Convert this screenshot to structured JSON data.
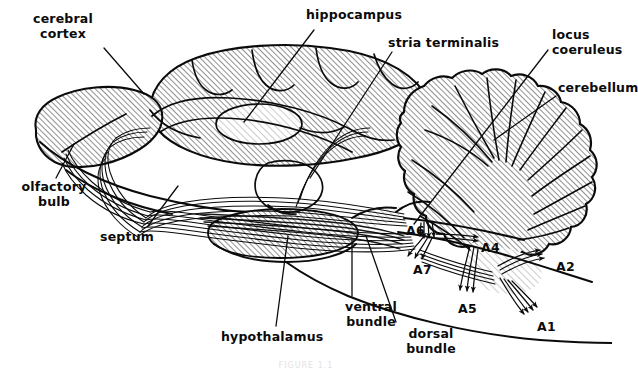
{
  "figure": {
    "background_color": "#ffffff",
    "ink_color": "#0b0b0b",
    "hatch_color": "#4a4a4a",
    "caption": "FIGURE 1.1"
  },
  "labels": [
    {
      "id": "cerebral-cortex",
      "text": "cerebral\ncortex",
      "x": 18,
      "y": 14,
      "align": "center",
      "w": 90
    },
    {
      "id": "hippocampus",
      "text": "hippocampus",
      "x": 306,
      "y": 10,
      "align": "left",
      "w": 110
    },
    {
      "id": "stria-terminalis",
      "text": "stria terminalis",
      "x": 388,
      "y": 38,
      "align": "left",
      "w": 120
    },
    {
      "id": "locus-coeruleus",
      "text": "locus\ncoeruleus",
      "x": 552,
      "y": 30,
      "align": "left",
      "w": 80
    },
    {
      "id": "cerebellum",
      "text": "cerebellum",
      "x": 558,
      "y": 83,
      "align": "left",
      "w": 80
    },
    {
      "id": "olfactory-bulb",
      "text": "olfactory\nbulb",
      "x": 12,
      "y": 182,
      "align": "center",
      "w": 86
    },
    {
      "id": "septum",
      "text": "septum",
      "x": 100,
      "y": 232,
      "align": "left",
      "w": 60
    },
    {
      "id": "hypothalamus",
      "text": "hypothalamus",
      "x": 221,
      "y": 332,
      "align": "left",
      "w": 110
    },
    {
      "id": "ventral-bundle",
      "text": "ventral\nbundle",
      "x": 336,
      "y": 302,
      "align": "center",
      "w": 70
    },
    {
      "id": "dorsal-bundle",
      "text": "dorsal\nbundle",
      "x": 396,
      "y": 329,
      "align": "center",
      "w": 70
    }
  ],
  "nuclei": [
    {
      "id": "A1",
      "text": "A1",
      "x": 537,
      "y": 322
    },
    {
      "id": "A2",
      "text": "A2",
      "x": 556,
      "y": 262
    },
    {
      "id": "A4",
      "text": "A4",
      "x": 481,
      "y": 243
    },
    {
      "id": "A5",
      "text": "A5",
      "x": 458,
      "y": 304
    },
    {
      "id": "A6",
      "text": "A6",
      "x": 406,
      "y": 226
    },
    {
      "id": "A7",
      "text": "A7",
      "x": 413,
      "y": 265
    }
  ],
  "regions": [
    {
      "id": "cerebral-cortex-region",
      "name": "cerebral cortex",
      "shaded": true
    },
    {
      "id": "olfactory-bulb-region",
      "name": "olfactory bulb",
      "shaded": true
    },
    {
      "id": "cerebellum-region",
      "name": "cerebellum",
      "shaded": true
    },
    {
      "id": "hippocampus-region",
      "name": "hippocampus",
      "shaded": true
    },
    {
      "id": "hypothalamus-region",
      "name": "hypothalamus",
      "shaded": true
    },
    {
      "id": "thalamus-region",
      "name": "thalamus",
      "shaded": false
    },
    {
      "id": "brainstem-region",
      "name": "brainstem",
      "shaded": true
    }
  ],
  "tracts": [
    {
      "id": "dorsal-bundle-tract",
      "name": "dorsal noradrenergic bundle"
    },
    {
      "id": "ventral-bundle-tract",
      "name": "ventral noradrenergic bundle"
    },
    {
      "id": "stria-terminalis-tract",
      "name": "stria terminalis"
    }
  ]
}
